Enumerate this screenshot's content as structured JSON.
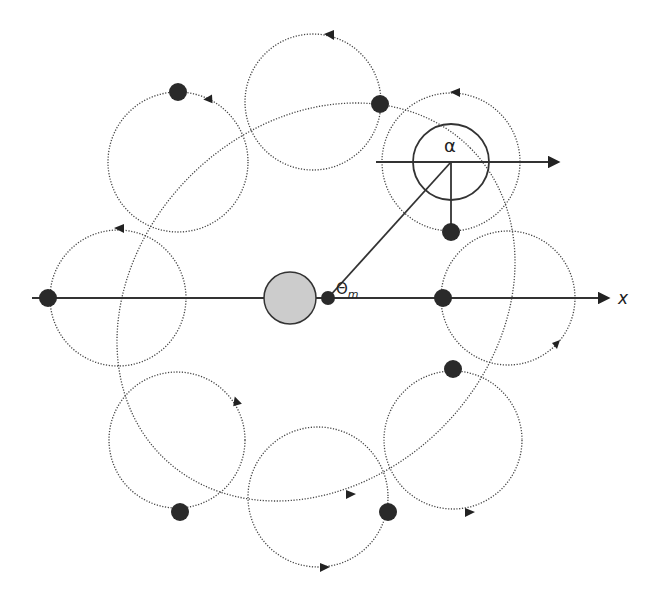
{
  "diagram": {
    "labels": {
      "alpha": "α",
      "theta_m": "Θ",
      "theta_sub": "m",
      "x_axis": "x"
    },
    "central_body": {
      "cx": 290,
      "cy": 298,
      "r": 26,
      "fill": "#cccccc"
    },
    "focus_dot": {
      "cx": 328,
      "cy": 298,
      "r": 7
    },
    "main_orbit": {
      "cx": 316,
      "cy": 302,
      "rx": 218,
      "ry": 178,
      "rotation": -45
    },
    "epicycles": [
      {
        "name": "left",
        "cx": 118,
        "cy": 298,
        "r": 68
      },
      {
        "name": "upper-left",
        "cx": 178,
        "cy": 162,
        "r": 70
      },
      {
        "name": "top",
        "cx": 313,
        "cy": 102,
        "r": 68
      },
      {
        "name": "upper-right",
        "cx": 451,
        "cy": 162,
        "r": 69
      },
      {
        "name": "right",
        "cx": 508,
        "cy": 298,
        "r": 67
      },
      {
        "name": "lower-right",
        "cx": 453,
        "cy": 440,
        "r": 69
      },
      {
        "name": "bottom",
        "cx": 318,
        "cy": 497,
        "r": 70
      },
      {
        "name": "lower-left",
        "cx": 177,
        "cy": 440,
        "r": 68
      }
    ],
    "bodies": [
      {
        "cx": 48,
        "cy": 298
      },
      {
        "cx": 178,
        "cy": 92
      },
      {
        "cx": 380,
        "cy": 104
      },
      {
        "cx": 451,
        "cy": 232
      },
      {
        "cx": 443,
        "cy": 298
      },
      {
        "cx": 453,
        "cy": 369
      },
      {
        "cx": 388,
        "cy": 512
      },
      {
        "cx": 180,
        "cy": 512
      }
    ],
    "colors": {
      "ink": "#2a2a2a",
      "central_fill": "#cccccc",
      "background": "#ffffff"
    }
  }
}
